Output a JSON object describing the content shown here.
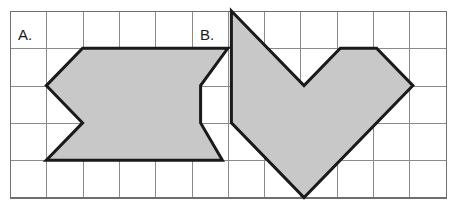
{
  "page": {
    "background_color": "#ffffff",
    "width": 450,
    "height": 215
  },
  "grid": {
    "origin_x": 10,
    "origin_y": 11,
    "cell_width": 36.3,
    "cell_height": 37.3,
    "columns": 12,
    "rows": 5,
    "line_color": "#8a8a8a",
    "border_color": "#6f6f6f",
    "show_grid": true
  },
  "style": {
    "shape_fill": "#c8c8c8",
    "shape_stroke": "#1a1a1a",
    "shape_stroke_width": 3,
    "label_color": "#1a1a1a",
    "label_font_size": "15px"
  },
  "shapes": [
    {
      "id": "shape-a",
      "label": "A.",
      "label_x": 18,
      "label_y": 40,
      "description": "hexagon-with-left-notch",
      "grid_points": [
        [
          2,
          1
        ],
        [
          4,
          1
        ],
        [
          5,
          2
        ],
        [
          5,
          3
        ],
        [
          5.85,
          4
        ],
        [
          1,
          4
        ],
        [
          2,
          3
        ],
        [
          1,
          2
        ]
      ],
      "points": "82.6,48.3 227.8,48.3 200.6,85.6 200.6,122.9 222.4,160.2 46.3,160.2 82.6,122.9 46.3,85.6",
      "vertex_count": 8
    },
    {
      "id": "shape-b",
      "label": "B.",
      "label_x": 200,
      "label_y": 40,
      "description": "heart-shaped-polygon",
      "grid_points": [
        [
          6.1,
          0
        ],
        [
          8.1,
          2
        ],
        [
          9.1,
          1
        ],
        [
          10.1,
          1
        ],
        [
          11.1,
          2
        ],
        [
          8.1,
          5
        ],
        [
          6.1,
          3
        ]
      ],
      "points": "231.4,11.0 304.0,85.6 340.3,48.3 376.6,48.3 412.9,85.6 304.0,197.5 231.4,122.9",
      "vertex_count": 7
    }
  ],
  "labels": {
    "shape_a_label": "A.",
    "shape_b_label": "B."
  }
}
